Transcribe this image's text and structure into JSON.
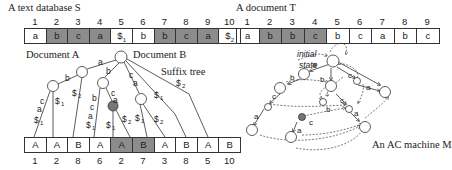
{
  "left": {
    "title": "A text database S",
    "doc_a_label": "Document A",
    "doc_b_label": "Document B",
    "suffix_tree_label": "Suffix tree",
    "database": {
      "indices": [
        "1",
        "2",
        "3",
        "4",
        "5",
        "6",
        "7",
        "8",
        "9",
        "10"
      ],
      "cells": [
        {
          "text": "a",
          "shade": "none"
        },
        {
          "text": "b",
          "shade": "dark"
        },
        {
          "text": "c",
          "shade": "dark"
        },
        {
          "text": "a",
          "shade": "dark"
        },
        {
          "text": "$1",
          "shade": "none"
        },
        {
          "text": "b",
          "shade": "none"
        },
        {
          "text": "b",
          "shade": "dark"
        },
        {
          "text": "c",
          "shade": "dark"
        },
        {
          "text": "a",
          "shade": "dark"
        },
        {
          "text": "$2",
          "shade": "none"
        }
      ]
    },
    "leaves": {
      "cells": [
        {
          "text": "A",
          "shade": "none"
        },
        {
          "text": "A",
          "shade": "none"
        },
        {
          "text": "B",
          "shade": "none"
        },
        {
          "text": "A",
          "shade": "none"
        },
        {
          "text": "A",
          "shade": "dark"
        },
        {
          "text": "B",
          "shade": "dark"
        },
        {
          "text": "A",
          "shade": "none"
        },
        {
          "text": "B",
          "shade": "none"
        },
        {
          "text": "A",
          "shade": "none"
        },
        {
          "text": "B",
          "shade": "none"
        }
      ],
      "indices": [
        "1",
        "2",
        "8",
        "6",
        "2",
        "7",
        "3",
        "8",
        "5",
        "10"
      ]
    },
    "edge_labels": [
      "a",
      "b",
      "b",
      "c",
      "a",
      "$1",
      "$1",
      "$2",
      "b",
      "c",
      "a",
      "$1",
      "c",
      "a",
      "$1",
      "$2",
      "c",
      "a",
      "$1",
      "$2",
      "$1",
      "$2"
    ]
  },
  "right": {
    "title": "A document T",
    "document": {
      "indices": [
        "1",
        "2",
        "3",
        "4",
        "5",
        "6",
        "7",
        "8",
        "9"
      ],
      "cells": [
        {
          "text": "a",
          "shade": "none"
        },
        {
          "text": "b",
          "shade": "dark"
        },
        {
          "text": "b",
          "shade": "dark"
        },
        {
          "text": "c",
          "shade": "dark"
        },
        {
          "text": "b",
          "shade": "none"
        },
        {
          "text": "c",
          "shade": "none"
        },
        {
          "text": "a",
          "shade": "none"
        },
        {
          "text": "b",
          "shade": "none"
        },
        {
          "text": "c",
          "shade": "none"
        }
      ]
    },
    "initial_state_label_1": "initial",
    "initial_state_label_2": "state",
    "machine_label": "An AC machine M",
    "edge_labels": [
      "a",
      "b",
      "b",
      "c",
      "c",
      "a",
      "a",
      "b",
      "c",
      "c",
      "a",
      "a"
    ]
  },
  "colors": {
    "dark_cell": "#8c8c8c",
    "highlight_node": "#777777",
    "line": "#333333"
  }
}
